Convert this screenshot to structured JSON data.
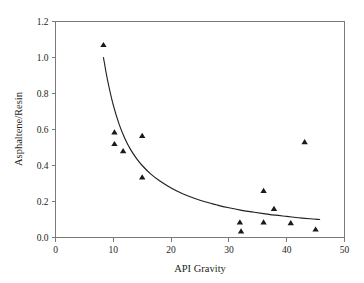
{
  "chart_data": {
    "type": "scatter",
    "title": "",
    "xlabel": "API Gravity",
    "ylabel": "Asphaltene/Resin",
    "xlim": [
      0,
      50
    ],
    "ylim": [
      0.0,
      1.2
    ],
    "xticks": [
      0,
      10,
      20,
      30,
      40,
      50
    ],
    "yticks": [
      0.0,
      0.2,
      0.4,
      0.6,
      0.8,
      1.0,
      1.2
    ],
    "xtick_labels": [
      "0",
      "10",
      "20",
      "30",
      "40",
      "50"
    ],
    "ytick_labels": [
      "0.0",
      "0.2",
      "0.4",
      "0.6",
      "0.8",
      "1.0",
      "1.2"
    ],
    "grid": false,
    "legend": false,
    "marker": "triangle-up",
    "marker_color": "#1a1a1a",
    "curve_color": "#231f20",
    "frame": "box-open-right",
    "series": [
      {
        "name": "Crude oil samples",
        "marker": "triangle-up",
        "points": [
          {
            "x": 8.3,
            "y": 1.07
          },
          {
            "x": 10.2,
            "y": 0.585
          },
          {
            "x": 10.2,
            "y": 0.52
          },
          {
            "x": 11.7,
            "y": 0.48
          },
          {
            "x": 15.0,
            "y": 0.565
          },
          {
            "x": 15.0,
            "y": 0.335
          },
          {
            "x": 31.9,
            "y": 0.085
          },
          {
            "x": 32.1,
            "y": 0.035
          },
          {
            "x": 36.0,
            "y": 0.26
          },
          {
            "x": 36.0,
            "y": 0.085
          },
          {
            "x": 37.8,
            "y": 0.16
          },
          {
            "x": 40.7,
            "y": 0.08
          },
          {
            "x": 43.1,
            "y": 0.53
          },
          {
            "x": 45.0,
            "y": 0.045
          }
        ]
      }
    ],
    "fit_curve": {
      "name": "Power-law trend",
      "description": "Decreasing power-law fit through scatter",
      "x_start": 8.3,
      "x_end": 45.7,
      "y_start": 1.0,
      "y_end": 0.1,
      "points": [
        {
          "x": 8.3,
          "y": 1.0
        },
        {
          "x": 9.0,
          "y": 0.875
        },
        {
          "x": 10.0,
          "y": 0.735
        },
        {
          "x": 11.0,
          "y": 0.63
        },
        {
          "x": 12.0,
          "y": 0.55
        },
        {
          "x": 13.0,
          "y": 0.488
        },
        {
          "x": 14.0,
          "y": 0.44
        },
        {
          "x": 15.0,
          "y": 0.4
        },
        {
          "x": 16.5,
          "y": 0.352
        },
        {
          "x": 18.0,
          "y": 0.315
        },
        {
          "x": 20.0,
          "y": 0.275
        },
        {
          "x": 22.0,
          "y": 0.243
        },
        {
          "x": 24.0,
          "y": 0.218
        },
        {
          "x": 26.0,
          "y": 0.197
        },
        {
          "x": 28.0,
          "y": 0.18
        },
        {
          "x": 30.0,
          "y": 0.165
        },
        {
          "x": 32.0,
          "y": 0.152
        },
        {
          "x": 34.0,
          "y": 0.142
        },
        {
          "x": 36.0,
          "y": 0.133
        },
        {
          "x": 38.0,
          "y": 0.124
        },
        {
          "x": 40.0,
          "y": 0.117
        },
        {
          "x": 42.0,
          "y": 0.11
        },
        {
          "x": 44.0,
          "y": 0.104
        },
        {
          "x": 45.7,
          "y": 0.1
        }
      ]
    }
  }
}
